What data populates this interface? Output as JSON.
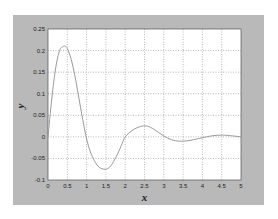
{
  "chart_data": {
    "type": "line",
    "title": "",
    "xlabel": "x",
    "ylabel": "y",
    "xlim": [
      0,
      5
    ],
    "ylim": [
      -0.1,
      0.25
    ],
    "grid": true,
    "legend": null,
    "x_ticks": [
      "0",
      "0.5",
      "1",
      "1.5",
      "2",
      "2.5",
      "3",
      "3.5",
      "4",
      "4.5",
      "5"
    ],
    "y_ticks": [
      "-0.1",
      "-0.05",
      "0",
      "0.05",
      "0.1",
      "0.15",
      "0.2",
      "0.25"
    ],
    "series": [
      {
        "name": "y(x)",
        "color": "#9a9a9a",
        "x": [
          0,
          0.1,
          0.2,
          0.3,
          0.4,
          0.45,
          0.5,
          0.6,
          0.7,
          0.8,
          0.9,
          1.0,
          1.1,
          1.2,
          1.3,
          1.4,
          1.5,
          1.6,
          1.7,
          1.8,
          1.9,
          2.0,
          2.2,
          2.4,
          2.55,
          2.7,
          2.9,
          3.1,
          3.3,
          3.5,
          3.7,
          3.9,
          4.1,
          4.3,
          4.5,
          4.7,
          5.0
        ],
        "y": [
          0,
          0.09,
          0.16,
          0.2,
          0.21,
          0.21,
          0.205,
          0.18,
          0.14,
          0.09,
          0.04,
          -0.005,
          -0.035,
          -0.055,
          -0.068,
          -0.074,
          -0.075,
          -0.07,
          -0.057,
          -0.04,
          -0.02,
          0.0,
          0.016,
          0.024,
          0.025,
          0.02,
          0.008,
          -0.003,
          -0.009,
          -0.01,
          -0.008,
          -0.004,
          0.0,
          0.003,
          0.004,
          0.003,
          0.0
        ]
      }
    ]
  },
  "colors": {
    "frame": "#b9b9b9",
    "plot_bg": "#ffffff",
    "grid": "#8a8a8a",
    "line": "#9a9a9a"
  }
}
